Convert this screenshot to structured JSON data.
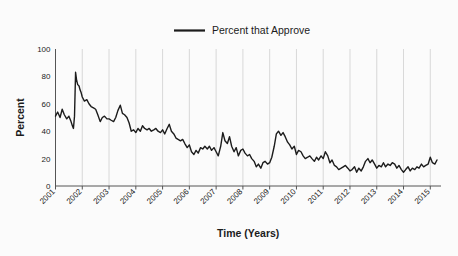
{
  "chart_data": {
    "type": "line",
    "title": "",
    "xlabel": "Time (Years)",
    "ylabel": "Percent",
    "xlim": [
      2001,
      2015.4
    ],
    "ylim": [
      0,
      100
    ],
    "grid": "vertical",
    "legend_position": "top-center",
    "line_color": "#1c1c1c",
    "background_color": "#fbfbfb",
    "gridline_color": "#cfcfcf",
    "axis_color": "#555555",
    "series": [
      {
        "name": "Percent that Approve",
        "x": [
          2001.0,
          2001.08,
          2001.17,
          2001.25,
          2001.33,
          2001.42,
          2001.5,
          2001.58,
          2001.63,
          2001.67,
          2001.71,
          2001.75,
          2001.79,
          2001.83,
          2001.88,
          2001.92,
          2001.96,
          2002.0,
          2002.08,
          2002.17,
          2002.25,
          2002.33,
          2002.42,
          2002.5,
          2002.58,
          2002.67,
          2002.75,
          2002.83,
          2002.92,
          2003.0,
          2003.08,
          2003.17,
          2003.25,
          2003.33,
          2003.42,
          2003.5,
          2003.58,
          2003.67,
          2003.75,
          2003.83,
          2003.92,
          2004.0,
          2004.08,
          2004.17,
          2004.25,
          2004.33,
          2004.42,
          2004.5,
          2004.58,
          2004.67,
          2004.75,
          2004.83,
          2004.92,
          2005.0,
          2005.08,
          2005.17,
          2005.25,
          2005.33,
          2005.42,
          2005.5,
          2005.58,
          2005.67,
          2005.75,
          2005.83,
          2005.92,
          2006.0,
          2006.08,
          2006.17,
          2006.25,
          2006.33,
          2006.42,
          2006.5,
          2006.58,
          2006.67,
          2006.75,
          2006.83,
          2006.92,
          2007.0,
          2007.08,
          2007.17,
          2007.25,
          2007.33,
          2007.42,
          2007.5,
          2007.58,
          2007.67,
          2007.75,
          2007.83,
          2007.92,
          2008.0,
          2008.08,
          2008.17,
          2008.25,
          2008.33,
          2008.42,
          2008.5,
          2008.58,
          2008.67,
          2008.75,
          2008.83,
          2008.92,
          2009.0,
          2009.08,
          2009.17,
          2009.25,
          2009.33,
          2009.42,
          2009.5,
          2009.58,
          2009.67,
          2009.75,
          2009.83,
          2009.92,
          2010.0,
          2010.08,
          2010.17,
          2010.25,
          2010.33,
          2010.42,
          2010.5,
          2010.58,
          2010.67,
          2010.75,
          2010.83,
          2010.92,
          2011.0,
          2011.08,
          2011.17,
          2011.25,
          2011.33,
          2011.42,
          2011.5,
          2011.58,
          2011.67,
          2011.75,
          2011.83,
          2011.92,
          2012.0,
          2012.08,
          2012.17,
          2012.25,
          2012.33,
          2012.42,
          2012.5,
          2012.58,
          2012.67,
          2012.75,
          2012.83,
          2012.92,
          2013.0,
          2013.08,
          2013.17,
          2013.25,
          2013.33,
          2013.42,
          2013.5,
          2013.58,
          2013.67,
          2013.75,
          2013.83,
          2013.92,
          2014.0,
          2014.08,
          2014.17,
          2014.25,
          2014.33,
          2014.42,
          2014.5,
          2014.58,
          2014.67,
          2014.75,
          2014.83,
          2014.92,
          2015.0,
          2015.08,
          2015.17,
          2015.25
        ],
        "values": [
          51,
          54,
          50,
          56,
          52,
          49,
          51,
          47,
          44,
          42,
          51,
          83,
          77,
          74,
          73,
          70,
          68,
          65,
          62,
          63,
          60,
          58,
          57,
          56,
          52,
          47,
          50,
          51,
          49,
          49,
          48,
          47,
          50,
          55,
          59,
          53,
          52,
          50,
          46,
          40,
          41,
          39,
          42,
          40,
          44,
          42,
          41,
          42,
          40,
          41,
          42,
          40,
          39,
          41,
          38,
          42,
          45,
          40,
          38,
          35,
          34,
          33,
          34,
          31,
          28,
          30,
          25,
          23,
          26,
          24,
          28,
          27,
          29,
          27,
          29,
          26,
          28,
          25,
          22,
          29,
          39,
          33,
          31,
          36,
          29,
          25,
          28,
          22,
          26,
          27,
          24,
          22,
          23,
          20,
          18,
          14,
          16,
          13,
          17,
          18,
          16,
          17,
          21,
          29,
          38,
          40,
          37,
          39,
          36,
          32,
          30,
          27,
          29,
          23,
          26,
          25,
          22,
          20,
          21,
          22,
          20,
          18,
          21,
          19,
          22,
          20,
          25,
          22,
          17,
          19,
          15,
          14,
          12,
          13,
          14,
          15,
          13,
          11,
          12,
          14,
          10,
          13,
          11,
          14,
          18,
          20,
          17,
          19,
          16,
          13,
          15,
          14,
          17,
          14,
          16,
          15,
          17,
          16,
          13,
          15,
          12,
          10,
          12,
          14,
          11,
          13,
          12,
          14,
          13,
          16,
          14,
          15,
          16,
          21,
          17,
          16,
          19
        ]
      }
    ],
    "x_tick_labels": [
      "2001",
      "2002",
      "2003",
      "2004",
      "2005",
      "2006",
      "2007",
      "2008",
      "2009",
      "2010",
      "2011",
      "2012",
      "2013",
      "2014",
      "2015"
    ],
    "x_tick_values": [
      2001,
      2002,
      2003,
      2004,
      2005,
      2006,
      2007,
      2008,
      2009,
      2010,
      2011,
      2012,
      2013,
      2014,
      2015
    ],
    "y_tick_labels": [
      "0",
      "20",
      "40",
      "60",
      "80",
      "100"
    ],
    "y_tick_values": [
      0,
      20,
      40,
      60,
      80,
      100
    ]
  },
  "legend": {
    "entries": [
      {
        "label": "Percent that Approve",
        "color": "#1c1c1c"
      }
    ]
  },
  "axes": {
    "x_title": "Time (Years)",
    "y_title": "Percent"
  }
}
